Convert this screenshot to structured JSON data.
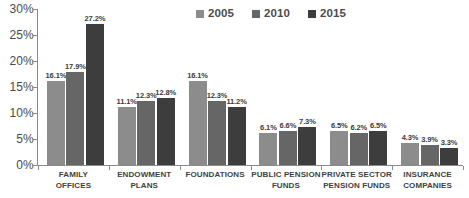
{
  "chart_data": {
    "type": "bar",
    "title": "",
    "subtitle": "",
    "xlabel": "",
    "ylabel": "",
    "ylim": [
      0,
      30
    ],
    "ytick_labels": [
      "30%",
      "25%",
      "20%",
      "15%",
      "10%",
      "5%",
      "0%"
    ],
    "ytick_values": [
      30,
      25,
      20,
      15,
      10,
      5,
      0
    ],
    "grid": false,
    "legend_position": "top-center",
    "value_suffix": "%",
    "categories": [
      "FAMILY OFFICES",
      "ENDOWMENT PLANS",
      "FOUNDATIONS",
      "PUBLIC PENSION FUNDS",
      "PRIVATE SECTOR PENSION FUNDS",
      "INSURANCE COMPANIES"
    ],
    "category_lines": [
      [
        "FAMILY",
        "OFFICES"
      ],
      [
        "ENDOWMENT",
        "PLANS"
      ],
      [
        "FOUNDATIONS"
      ],
      [
        "PUBLIC PENSION",
        "FUNDS"
      ],
      [
        "PRIVATE SECTOR",
        "PENSION FUNDS"
      ],
      [
        "INSURANCE",
        "COMPANIES"
      ]
    ],
    "series": [
      {
        "name": "2005",
        "color": "#8c8c8c",
        "values": [
          16.1,
          11.1,
          16.1,
          6.1,
          6.5,
          4.3
        ],
        "labels": [
          "16.1%",
          "11.1%",
          "16.1%",
          "6.1%",
          "6.5%",
          "4.3%"
        ]
      },
      {
        "name": "2010",
        "color": "#666666",
        "values": [
          17.9,
          12.3,
          12.3,
          6.6,
          6.2,
          3.9
        ],
        "labels": [
          "17.9%",
          "12.3%",
          "12.3%",
          "6.6%",
          "6.2%",
          "3.9%"
        ]
      },
      {
        "name": "2015",
        "color": "#3d3d3d",
        "values": [
          27.2,
          12.8,
          11.2,
          7.3,
          6.5,
          3.3
        ],
        "labels": [
          "27.2%",
          "12.8%",
          "11.2%",
          "7.3%",
          "6.5%",
          "3.3%"
        ]
      }
    ]
  }
}
